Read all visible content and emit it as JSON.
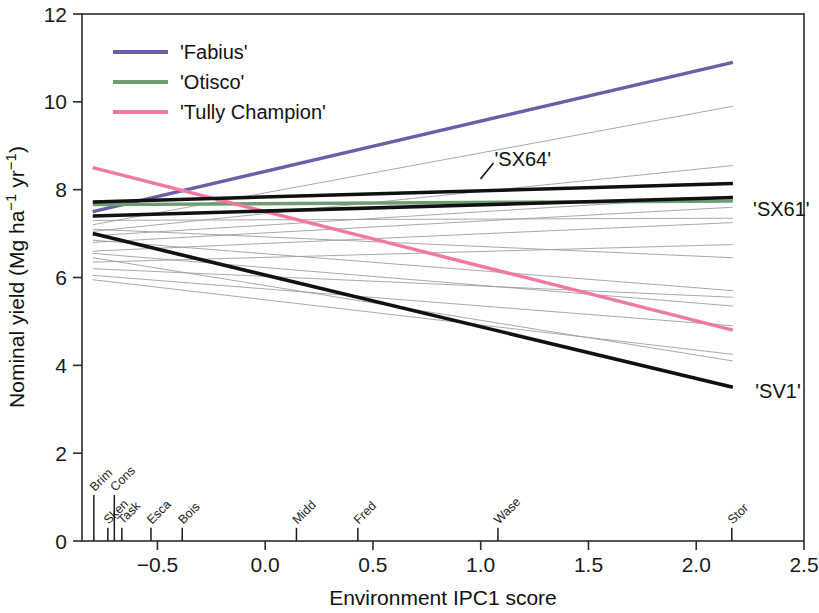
{
  "chart_data": {
    "type": "line",
    "title": "",
    "xlabel": "Environment IPC1 score",
    "ylabel": "Nominal yield (Mg ha−1 yr−1)",
    "ylabel_parts": {
      "prefix": "Nominal yield (Mg ha",
      "sup1": "−1",
      "mid": " yr",
      "sup2": "−1",
      "suffix": ")"
    },
    "xlim": [
      -0.85,
      2.5
    ],
    "ylim": [
      0,
      12
    ],
    "xticks": [
      "-0.5",
      "0.0",
      "0.5",
      "1.0",
      "1.5",
      "2.0",
      "2.5"
    ],
    "xtick_values": [
      -0.5,
      0.0,
      0.5,
      1.0,
      1.5,
      2.0,
      2.5
    ],
    "yticks": [
      "0",
      "2",
      "4",
      "6",
      "8",
      "10",
      "12"
    ],
    "ytick_values": [
      0,
      2,
      4,
      6,
      8,
      10,
      12
    ],
    "grid": false,
    "legend_position": "top-left",
    "legend": [
      {
        "label": "'Fabius'",
        "color": "#6a5ea6"
      },
      {
        "label": "'Otisco'",
        "color": "#6d9e72"
      },
      {
        "label": "'Tully Champion'",
        "color": "#ef7a9e"
      }
    ],
    "series": [
      {
        "name": "'Fabius'",
        "color": "#6a5ea6",
        "width": 3.4,
        "highlight": true,
        "x": [
          -0.8,
          2.17
        ],
        "y": [
          7.5,
          10.9
        ]
      },
      {
        "name": "'Otisco'",
        "color": "#6d9e72",
        "width": 3.4,
        "highlight": true,
        "x": [
          -0.8,
          2.17
        ],
        "y": [
          7.66,
          7.74
        ]
      },
      {
        "name": "'Tully Champion'",
        "color": "#ef7a9e",
        "width": 3.4,
        "highlight": true,
        "x": [
          -0.8,
          2.17
        ],
        "y": [
          8.5,
          4.8
        ]
      },
      {
        "name": "'SX64'",
        "color": "#111111",
        "width": 3.6,
        "highlight": true,
        "x": [
          -0.8,
          2.17
        ],
        "y": [
          7.72,
          8.14
        ]
      },
      {
        "name": "'SX61'",
        "color": "#111111",
        "width": 3.6,
        "highlight": true,
        "x": [
          -0.8,
          2.17
        ],
        "y": [
          7.4,
          7.82
        ]
      },
      {
        "name": "'SV1'",
        "color": "#111111",
        "width": 3.6,
        "highlight": true,
        "x": [
          -0.8,
          2.17
        ],
        "y": [
          7.0,
          3.5
        ]
      },
      {
        "name": "g01",
        "color": "#9a9a9a",
        "width": 0.85,
        "highlight": false,
        "x": [
          -0.8,
          2.17
        ],
        "y": [
          7.2,
          9.9
        ]
      },
      {
        "name": "g02",
        "color": "#9a9a9a",
        "width": 0.85,
        "highlight": false,
        "x": [
          -0.8,
          2.17
        ],
        "y": [
          7.05,
          8.55
        ]
      },
      {
        "name": "g03",
        "color": "#9a9a9a",
        "width": 0.85,
        "highlight": false,
        "x": [
          -0.8,
          2.17
        ],
        "y": [
          6.95,
          7.85
        ]
      },
      {
        "name": "g04",
        "color": "#9a9a9a",
        "width": 0.85,
        "highlight": false,
        "x": [
          -0.8,
          2.17
        ],
        "y": [
          6.8,
          7.6
        ]
      },
      {
        "name": "g05",
        "color": "#9a9a9a",
        "width": 0.85,
        "highlight": false,
        "x": [
          -0.8,
          2.17
        ],
        "y": [
          7.3,
          7.35
        ]
      },
      {
        "name": "g06",
        "color": "#9a9a9a",
        "width": 0.85,
        "highlight": false,
        "x": [
          -0.8,
          2.17
        ],
        "y": [
          6.6,
          7.25
        ]
      },
      {
        "name": "g07",
        "color": "#9a9a9a",
        "width": 0.85,
        "highlight": false,
        "x": [
          -0.8,
          2.17
        ],
        "y": [
          6.35,
          6.75
        ]
      },
      {
        "name": "g08",
        "color": "#9a9a9a",
        "width": 0.85,
        "highlight": false,
        "x": [
          -0.8,
          2.17
        ],
        "y": [
          7.1,
          6.45
        ]
      },
      {
        "name": "g09",
        "color": "#9a9a9a",
        "width": 0.85,
        "highlight": false,
        "x": [
          -0.8,
          2.17
        ],
        "y": [
          6.85,
          5.7
        ]
      },
      {
        "name": "g10",
        "color": "#9a9a9a",
        "width": 0.85,
        "highlight": false,
        "x": [
          -0.8,
          2.17
        ],
        "y": [
          6.55,
          5.35
        ]
      },
      {
        "name": "g11",
        "color": "#9a9a9a",
        "width": 0.85,
        "highlight": false,
        "x": [
          -0.8,
          2.17
        ],
        "y": [
          6.2,
          5.55
        ]
      },
      {
        "name": "g12",
        "color": "#9a9a9a",
        "width": 0.85,
        "highlight": false,
        "x": [
          -0.8,
          2.17
        ],
        "y": [
          6.05,
          4.9
        ]
      },
      {
        "name": "g13",
        "color": "#9a9a9a",
        "width": 0.85,
        "highlight": false,
        "x": [
          -0.8,
          2.17
        ],
        "y": [
          5.95,
          4.25
        ]
      },
      {
        "name": "g14",
        "color": "#9a9a9a",
        "width": 0.85,
        "highlight": false,
        "x": [
          -0.8,
          2.17
        ],
        "y": [
          6.45,
          4.1
        ]
      }
    ],
    "annotations": [
      {
        "label": "'SX64'",
        "x": 1.05,
        "y": 8.7,
        "leader": true
      },
      {
        "label": "'SX61'",
        "x": 2.25,
        "y": 7.55,
        "leader": false
      },
      {
        "label": "'SV1'",
        "x": 2.26,
        "y": 3.42,
        "leader": false
      }
    ],
    "environments": [
      {
        "label": "Brim",
        "x": -0.795
      },
      {
        "label": "Sken",
        "x": -0.73
      },
      {
        "label": "Cons",
        "x": -0.7
      },
      {
        "label": "Task",
        "x": -0.665
      },
      {
        "label": "Esca",
        "x": -0.53
      },
      {
        "label": "Bois",
        "x": -0.385
      },
      {
        "label": "Midd",
        "x": 0.145
      },
      {
        "label": "Fred",
        "x": 0.43
      },
      {
        "label": "Wase",
        "x": 1.08
      },
      {
        "label": "Stor",
        "x": 2.165
      }
    ]
  }
}
